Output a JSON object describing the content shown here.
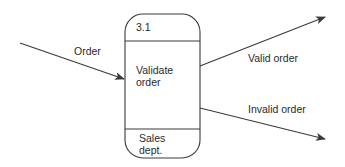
{
  "diagram": {
    "type": "data-flow-diagram",
    "process": {
      "id": "3.1",
      "name_line1": "Validate",
      "name_line2": "order",
      "location_line1": "Sales",
      "location_line2": "dept."
    },
    "flows": {
      "input": {
        "label": "Order"
      },
      "output_valid": {
        "label": "Valid order"
      },
      "output_invalid": {
        "label": "Invalid order"
      }
    },
    "colors": {
      "line": "#3a3a3a",
      "text": "#2a2a2a",
      "background": "#ffffff"
    }
  }
}
